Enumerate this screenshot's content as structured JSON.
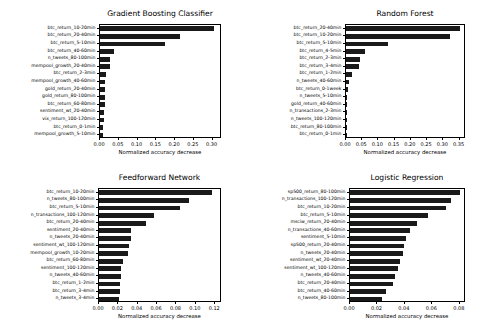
{
  "figure": {
    "width": 486,
    "height": 328,
    "background": "#ffffff",
    "bar_color": "#1a1a1a",
    "axis_color": "#000000",
    "layout": "2x2 grid of horizontal bar charts"
  },
  "chart_data": [
    {
      "type": "bar",
      "orientation": "horizontal",
      "title": "Gradient Boosting Classifier",
      "xlabel": "Normalized accuracy decrease",
      "ylabel": "",
      "xlim": [
        0.0,
        0.325
      ],
      "xticks": [
        0.0,
        0.05,
        0.1,
        0.15,
        0.2,
        0.25,
        0.3
      ],
      "xticklabels": [
        "0.00",
        "0.05",
        "0.10",
        "0.15",
        "0.20",
        "0.25",
        "0.30"
      ],
      "grid": false,
      "legend": null,
      "categories": [
        "btc_return_10-20min",
        "btc_return_20-40min",
        "btc_return_5-10min",
        "btc_return_40-60min",
        "n_tweets_80-100min",
        "mempool_growth_20-40min",
        "btc_return_2-3min",
        "mempool_growth_40-60min",
        "gold_return_20-40min",
        "gold_return_80-100min",
        "btc_return_60-80min",
        "sentiment_wt_20-40min",
        "vix_return_100-120min",
        "btc_return_0-1min",
        "mempool_growth_5-10min"
      ],
      "values": [
        0.305,
        0.212,
        0.173,
        0.036,
        0.027,
        0.026,
        0.017,
        0.014,
        0.013,
        0.013,
        0.012,
        0.011,
        0.01,
        0.009,
        0.008
      ]
    },
    {
      "type": "bar",
      "orientation": "horizontal",
      "title": "Random Forest",
      "xlabel": "Normalized accuracy decrease",
      "ylabel": "",
      "xlim": [
        0.0,
        0.37
      ],
      "xticks": [
        0.0,
        0.05,
        0.1,
        0.15,
        0.2,
        0.25,
        0.3,
        0.35
      ],
      "xticklabels": [
        "0.00",
        "0.05",
        "0.10",
        "0.15",
        "0.20",
        "0.25",
        "0.30",
        "0.35"
      ],
      "grid": false,
      "legend": null,
      "categories": [
        "btc_return_20-40min",
        "btc_return_10-20min",
        "btc_return_5-10min",
        "btc_return_4-5min",
        "btc_return_2-3min",
        "btc_return_3-4min",
        "btc_return_1-2min",
        "n_tweets_40-60min",
        "btc_return_0-1week",
        "n_tweets_5-10min",
        "gold_return_40-60min",
        "n_transactions_2-3min",
        "n_tweets_100-120min",
        "btc_return_80-100min",
        "btc_return_0-1min"
      ],
      "values": [
        0.35,
        0.32,
        0.131,
        0.058,
        0.042,
        0.041,
        0.017,
        0.008,
        0.005,
        0.004,
        0.004,
        0.003,
        0.001,
        0.001,
        0.001
      ]
    },
    {
      "type": "bar",
      "orientation": "horizontal",
      "title": "Feedforward Network",
      "xlabel": "Normalized accuracy decrease",
      "ylabel": "",
      "xlim": [
        0.0,
        0.127
      ],
      "xticks": [
        0.0,
        0.02,
        0.04,
        0.06,
        0.08,
        0.1,
        0.12
      ],
      "xticklabels": [
        "0.00",
        "0.02",
        "0.04",
        "0.06",
        "0.08",
        "0.10",
        "0.12"
      ],
      "grid": false,
      "legend": null,
      "categories": [
        "btc_return_10-20min",
        "n_tweets_80-100min",
        "btc_return_5-10min",
        "n_transactions_100-120min",
        "btc_return_20-40min",
        "sentiment_20-40min",
        "n_tweets_20-40min",
        "sentiment_wt_100-120min",
        "mempool_growth_10-20min",
        "btc_return_60-80min",
        "sentiment_100-120min",
        "n_tweets_40-60min",
        "btc_return_1-2min",
        "btc_return_3-4min",
        "n_tweets_3-4min"
      ],
      "values": [
        0.1165,
        0.0925,
        0.0835,
        0.0565,
        0.0485,
        0.0335,
        0.033,
        0.0313,
        0.03,
        0.0243,
        0.023,
        0.0222,
        0.0218,
        0.0212,
        0.0202
      ]
    },
    {
      "type": "bar",
      "orientation": "horizontal",
      "title": "Logistic Regression",
      "xlabel": "Normalized accuracy decrease",
      "ylabel": "",
      "xlim": [
        0.0,
        0.0845
      ],
      "xticks": [
        0.0,
        0.02,
        0.04,
        0.06,
        0.08
      ],
      "xticklabels": [
        "0.00",
        "0.02",
        "0.04",
        "0.06",
        "0.08"
      ],
      "grid": false,
      "legend": null,
      "categories": [
        "sp500_return_80-100min",
        "n_transactions_100-120min",
        "btc_return_10-20min",
        "btc_return_5-10min",
        "msciw_return_20-40min",
        "n_transactions_40-60min",
        "sentiment_5-10min",
        "sp500_return_20-40min",
        "n_tweets_20-40min",
        "sentiment_wt_20-40min",
        "sentiment_wt_100-120min",
        "n_tweets_40-60min",
        "btc_return_20-40min",
        "btc_return_40-60min",
        "n_tweets_80-100min"
      ],
      "values": [
        0.08,
        0.0737,
        0.07,
        0.057,
        0.0487,
        0.0435,
        0.0405,
        0.039,
        0.0385,
        0.0365,
        0.0353,
        0.033,
        0.0313,
        0.0265,
        0.0235
      ]
    }
  ]
}
